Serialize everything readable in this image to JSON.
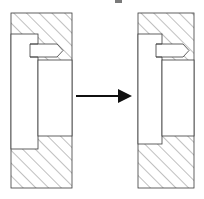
{
  "figure": {
    "background_color": "#ffffff",
    "line_color": "#3a3a3a",
    "hatch_color": "#4a4a4a",
    "arrow_color": "#101010",
    "width": 204,
    "height": 199
  },
  "panels": [
    {
      "id": "before",
      "label": "left-state",
      "description": "Hatched sectioned block with open vertical slot and partially inserted pin",
      "block": {
        "x": 11,
        "y": 13,
        "width": 61,
        "height": 175
      },
      "slot": {
        "x": 11,
        "y": 34,
        "width": 27,
        "height": 115
      },
      "cavity": {
        "x": 38,
        "y": 60,
        "width": 34,
        "height": 76
      },
      "pin": {
        "x": 30,
        "y": 44,
        "width": 33,
        "height": 13,
        "tip": "rounded"
      },
      "pin_state": "retracted"
    },
    {
      "id": "after",
      "label": "right-state",
      "description": "Hatched sectioned block with pin advanced and cavity reduced",
      "block": {
        "x": 138,
        "y": 13,
        "width": 56,
        "height": 175
      },
      "slot": {
        "x": 138,
        "y": 34,
        "width": 24,
        "height": 110
      },
      "cavity": {
        "x": 162,
        "y": 60,
        "width": 32,
        "height": 76
      },
      "pin": {
        "x": 156,
        "y": 44,
        "width": 33,
        "height": 13,
        "tip": "rounded"
      },
      "pin_state": "advanced"
    }
  ],
  "arrow": {
    "name": "transition-arrow",
    "direction": "right",
    "x_start": 76,
    "x_end": 132,
    "y": 96,
    "label": ""
  },
  "artifacts": [
    {
      "name": "top-smudge",
      "x": 115,
      "y": 0,
      "width": 7,
      "height": 3
    }
  ]
}
